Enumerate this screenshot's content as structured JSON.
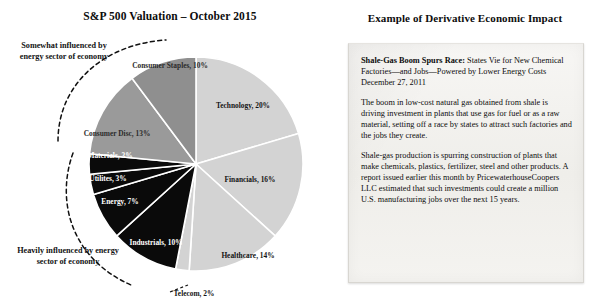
{
  "left": {
    "title": "S&P 500 Valuation – October 2015",
    "callouts": [
      {
        "id": "somewhat",
        "text": "Somewhat influenced by energy sector of economy"
      },
      {
        "id": "heavily",
        "text": "Heavily influenced by energy sector of economy"
      }
    ]
  },
  "right": {
    "title": "Example of Derivative Economic Impact",
    "article": {
      "headline_bold": "Shale-Gas Boom Spurs Race:",
      "headline_rest": " States Vie for New Chemical Factories—and Jobs—Powered by Lower Energy Costs",
      "date": "December 27, 2011",
      "paragraphs": [
        "The boom in low-cost natural gas obtained from shale is driving investment in plants that use gas for fuel or as a raw material, setting off a race by states to attract such factories and the jobs they create.",
        "Shale-gas production is spurring construction of plants that make chemicals, plastics, fertilizer, steel and other products. A report issued earlier this month by PricewaterhouseCoopers LLC estimated that such investments could create a million U.S. manufacturing jobs over the next 15 years."
      ]
    }
  },
  "chart_data": {
    "type": "pie",
    "title": "S&P 500 Valuation – October 2015",
    "start_angle_deg": 0,
    "direction": "clockwise",
    "center": [
      196,
      164
    ],
    "radius": 107,
    "legend": "none",
    "units": "percent",
    "categories": [
      "Technology",
      "Financials",
      "Healthcare",
      "Telecom",
      "Industrials",
      "Energy",
      "Utilites",
      "Materials",
      "Consumer Disc",
      "Consumer Staples"
    ],
    "values": [
      20,
      16,
      14,
      2,
      10,
      7,
      3,
      3,
      13,
      10
    ],
    "labels": [
      "Technology, 20%",
      "Financials, 16%",
      "Healthcare, 14%",
      "Telecom, 2%",
      "Industrials, 10%",
      "Energy, 7%",
      "Utilites, 3%",
      "Materials, 3%",
      "Consumer Disc, 13%",
      "Consumer Staples, 10%"
    ],
    "colors": [
      "#d3d3d3",
      "#d3d3d3",
      "#d3d3d3",
      "#d3d3d3",
      "#0a0a0a",
      "#0a0a0a",
      "#0a0a0a",
      "#0a0a0a",
      "#9a9a9a",
      "#8f8f8f"
    ],
    "label_tone": [
      "dark-text",
      "dark-text",
      "dark-text",
      "dark-text",
      "light-text",
      "light-text",
      "light-text",
      "light-text",
      "mid-text",
      "mid-text"
    ],
    "label_positions": [
      [
        243,
        108
      ],
      [
        250,
        182
      ],
      [
        248,
        258
      ],
      [
        194,
        296
      ],
      [
        156,
        245
      ],
      [
        120,
        204
      ],
      [
        108,
        181
      ],
      [
        110,
        158
      ],
      [
        117,
        136
      ],
      [
        170,
        68
      ]
    ],
    "label_anchor": [
      "middle",
      "middle",
      "middle",
      "middle",
      "middle",
      "middle",
      "middle",
      "middle",
      "middle",
      "middle"
    ],
    "external_label_index": 3,
    "annotations": [
      "Somewhat influenced by energy sector of economy",
      "Heavily influenced by energy sector of economy"
    ]
  }
}
